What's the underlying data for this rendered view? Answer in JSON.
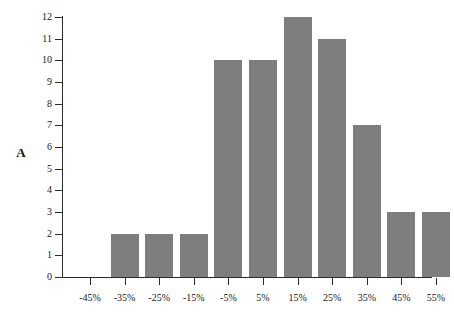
{
  "figure": {
    "panel_label": "A",
    "background_color": "#ffffff",
    "bar_color": "#7e7e7e",
    "axis_color": "#2b2b2b"
  },
  "chart_data": {
    "type": "bar",
    "title": "",
    "subtitle": "",
    "xlabel": "",
    "ylabel": "",
    "categories": [
      "-45%",
      "-35%",
      "-25%",
      "-15%",
      "-5%",
      "5%",
      "15%",
      "25%",
      "35%",
      "45%",
      "55%"
    ],
    "values": [
      0,
      2,
      2,
      2,
      10,
      10,
      12,
      11,
      7,
      3,
      3
    ],
    "ylim": [
      0,
      12
    ],
    "xlim_labels": [
      "-45%",
      "55%"
    ],
    "y_ticks": [
      0,
      1,
      2,
      3,
      4,
      5,
      6,
      7,
      8,
      9,
      10,
      11,
      12
    ],
    "y_tick_labels": [
      "0",
      "1",
      "2",
      "3",
      "4",
      "5",
      "6",
      "7",
      "8",
      "9",
      "10",
      "11",
      "12"
    ],
    "grid": false,
    "legend": null,
    "legend_position": "none",
    "annotations": [
      "A"
    ],
    "bar_color": "#7e7e7e"
  }
}
